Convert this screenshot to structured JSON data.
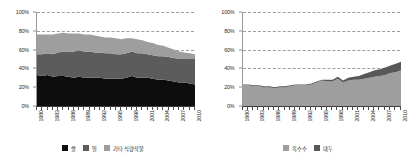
{
  "figure": {
    "panels": [
      "left",
      "right"
    ]
  },
  "chart_data": [
    {
      "type": "area",
      "title": "",
      "xlabel": "",
      "ylabel": "",
      "stacked": true,
      "percent_stacked": true,
      "grid": true,
      "gridlines": "horizontal dashed",
      "legend_position": "bottom",
      "ylim": [
        0,
        100
      ],
      "yticks": [
        "0%",
        "20%",
        "40%",
        "60%",
        "80%",
        "100%"
      ],
      "ytick_values": [
        0,
        20,
        40,
        60,
        80,
        100
      ],
      "xlim": [
        1980,
        2010
      ],
      "x": [
        1980,
        1981,
        1982,
        1983,
        1984,
        1985,
        1986,
        1987,
        1988,
        1989,
        1990,
        1991,
        1992,
        1993,
        1994,
        1995,
        1996,
        1997,
        1998,
        1999,
        2000,
        2001,
        2002,
        2003,
        2004,
        2005,
        2006,
        2007,
        2008,
        2009,
        2010
      ],
      "xticklabels": [
        "1980",
        "1983",
        "1986",
        "1989",
        "1992",
        "1995",
        "1998",
        "2001",
        "2004",
        "2007",
        "2010"
      ],
      "xtick_values": [
        1980,
        1983,
        1986,
        1989,
        1992,
        1995,
        1998,
        2001,
        2004,
        2007,
        2010
      ],
      "series": [
        {
          "name": "쌀",
          "color": "#0d0d0d",
          "values": [
            33,
            32,
            33,
            31,
            32,
            32,
            31,
            30,
            31,
            30,
            30,
            30,
            30,
            29,
            29,
            29,
            29,
            30,
            32,
            30,
            30,
            30,
            29,
            28,
            28,
            27,
            26,
            25,
            25,
            24,
            23
          ]
        },
        {
          "name": "밀",
          "color": "#5c5c5c",
          "values": [
            22,
            23,
            23,
            24,
            25,
            26,
            27,
            28,
            28,
            28,
            28,
            27,
            27,
            27,
            27,
            26,
            26,
            26,
            26,
            26,
            26,
            25,
            25,
            25,
            25,
            25,
            25,
            25,
            25,
            26,
            27
          ]
        },
        {
          "name": "기타 식량작물",
          "color": "#9e9e9e",
          "values": [
            21,
            21,
            20,
            21,
            20,
            20,
            19,
            19,
            18,
            18,
            18,
            18,
            17,
            17,
            17,
            17,
            16,
            16,
            14,
            15,
            14,
            13,
            13,
            12,
            11,
            10,
            9,
            8,
            7,
            6,
            5
          ]
        }
      ]
    },
    {
      "type": "area",
      "title": "",
      "xlabel": "",
      "ylabel": "",
      "stacked": true,
      "percent_stacked": true,
      "grid": true,
      "gridlines": "horizontal dashed",
      "legend_position": "bottom",
      "ylim": [
        0,
        100
      ],
      "yticks": [
        "0%",
        "20%",
        "40%",
        "60%",
        "80%",
        "100%"
      ],
      "ytick_values": [
        0,
        20,
        40,
        60,
        80,
        100
      ],
      "xlim": [
        1980,
        2010
      ],
      "x": [
        1980,
        1981,
        1982,
        1983,
        1984,
        1985,
        1986,
        1987,
        1988,
        1989,
        1990,
        1991,
        1992,
        1993,
        1994,
        1995,
        1996,
        1997,
        1998,
        1999,
        2000,
        2001,
        2002,
        2003,
        2004,
        2005,
        2006,
        2007,
        2008,
        2009,
        2010
      ],
      "xticklabels": [
        "1980",
        "1983",
        "1986",
        "1989",
        "1992",
        "1995",
        "1998",
        "2001",
        "2004",
        "2007",
        "2010"
      ],
      "xtick_values": [
        1980,
        1983,
        1986,
        1989,
        1992,
        1995,
        1998,
        2001,
        2004,
        2007,
        2010
      ],
      "series": [
        {
          "name": "옥수수",
          "color": "#9e9e9e",
          "values": [
            22,
            22,
            21,
            21,
            20,
            20,
            19,
            20,
            20,
            21,
            22,
            22,
            22,
            23,
            25,
            27,
            26,
            26,
            29,
            25,
            27,
            28,
            28,
            29,
            30,
            31,
            32,
            33,
            35,
            36,
            38
          ]
        },
        {
          "name": "대두",
          "color": "#585858",
          "values": [
            1,
            1,
            1,
            1,
            1,
            1,
            1,
            1,
            1,
            1,
            1,
            1,
            1,
            1,
            1,
            1,
            2,
            2,
            2,
            2,
            3,
            3,
            4,
            5,
            6,
            7,
            7,
            8,
            8,
            9,
            9
          ]
        }
      ]
    }
  ]
}
